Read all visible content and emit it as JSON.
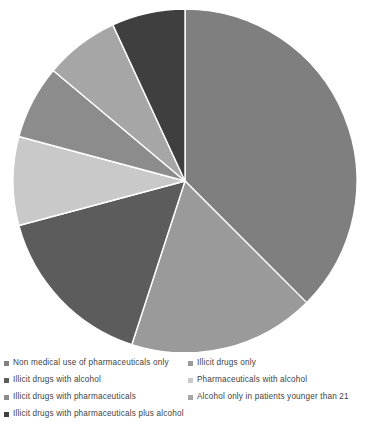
{
  "chart_data": {
    "type": "pie",
    "title": "",
    "subtitle": "",
    "xlabel": "",
    "ylabel": "",
    "grid": false,
    "legend_position": "bottom",
    "legend_columns": 2,
    "start_angle_deg": 0,
    "direction": "clockwise",
    "center": {
      "x": 185,
      "y": 181
    },
    "radius": 172,
    "slice_border_color": "#ffffff",
    "slice_border_width": 1.4,
    "categories": [
      "Non medical use of pharmaceuticals only",
      "Illicit drugs only",
      "Illicit drugs with alcohol",
      "Pharmaceuticals with alcohol",
      "Illicit drugs with pharmaceuticals",
      "Alcohol only in patients younger than 21",
      "Illicit drugs with pharmaceuticals plus alcohol"
    ],
    "values": [
      37.5,
      17.5,
      15.8,
      8.3,
      7.0,
      7.0,
      6.9
    ],
    "units": "percent",
    "colors": [
      "#7f7f7f",
      "#9a9a9a",
      "#5c5c5c",
      "#c9c9c9",
      "#8c8c8c",
      "#a6a6a6",
      "#3f3f3f"
    ],
    "angles_deg": [
      {
        "start": 0,
        "end": 135.0
      },
      {
        "start": 135.0,
        "end": 198.0
      },
      {
        "start": 198.0,
        "end": 255.0
      },
      {
        "start": 255.0,
        "end": 285.0
      },
      {
        "start": 285.0,
        "end": 310.0
      },
      {
        "start": 310.0,
        "end": 335.2
      },
      {
        "start": 335.2,
        "end": 360.0
      }
    ]
  },
  "legend": {
    "rows": [
      {
        "left": {
          "label": "Non medical use of pharmaceuticals only",
          "color": "#7f7f7f"
        },
        "right": {
          "label": "Illicit drugs only",
          "color": "#9a9a9a"
        }
      },
      {
        "left": {
          "label": "Illicit drugs with alcohol",
          "color": "#5c5c5c"
        },
        "right": {
          "label": "Pharmaceuticals with alcohol",
          "color": "#c9c9c9"
        }
      },
      {
        "left": {
          "label": "Illicit drugs with pharmaceuticals",
          "color": "#8c8c8c"
        },
        "right": {
          "label": "Alcohol only in patients younger than 21",
          "color": "#a6a6a6"
        }
      },
      {
        "left": {
          "label": "Illicit drugs with pharmaceuticals plus alcohol",
          "color": "#3f3f3f"
        },
        "right": null
      }
    ]
  }
}
